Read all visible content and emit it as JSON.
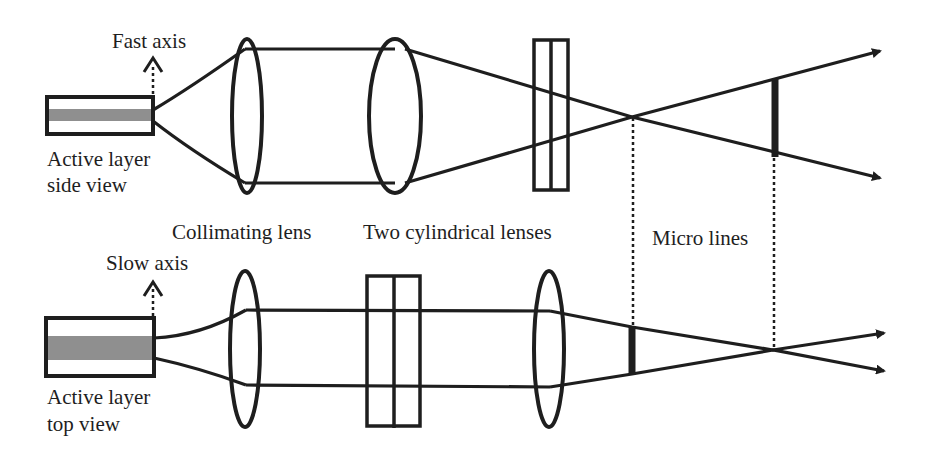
{
  "diagram": {
    "type": "optical beam-shaping schematic",
    "colors": {
      "line": "#1e1e1e",
      "active_layer_fill": "#8f8f8f",
      "background": "#ffffff"
    },
    "top_view_row": {
      "name": "side view (fast axis)",
      "axis_label": "Fast axis",
      "emitter_label_line1": "Active layer",
      "emitter_label_line2": "side view",
      "components": [
        "emitter",
        "collimating lens",
        "lens",
        "two cylindrical lenses",
        "focus crossing",
        "micro line"
      ]
    },
    "bottom_view_row": {
      "name": "top view (slow axis)",
      "axis_label": "Slow axis",
      "emitter_label_line1": "Active layer",
      "emitter_label_line2": "top view",
      "components": [
        "emitter",
        "collimating lens",
        "two cylindrical lenses",
        "lens",
        "micro line",
        "focus crossing"
      ]
    },
    "labels": {
      "collimating_lens": "Collimating lens",
      "cylindrical_lenses": "Two cylindrical lenses",
      "micro_lines": "Micro lines"
    }
  }
}
